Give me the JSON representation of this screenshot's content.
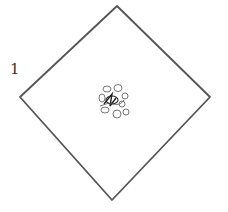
{
  "figure": {
    "label": "1",
    "shape": "diamond",
    "stroke_color": "#555555",
    "center_mark": "scribble-flower"
  }
}
